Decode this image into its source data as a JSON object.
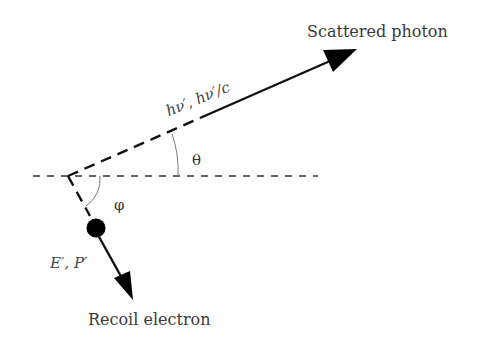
{
  "diagram": {
    "labels": {
      "scattered_photon": "Scattered photon",
      "photon_quantity": "hν′, hν′/c",
      "theta": "θ",
      "phi": "φ",
      "electron_quantity": "E′, P′",
      "recoil_electron": "Recoil electron"
    },
    "colors": {
      "line": "#111111",
      "arc": "#777777",
      "text": "#333333",
      "background": "#ffffff"
    },
    "geometry": {
      "origin": [
        68,
        176
      ],
      "incident_axis": {
        "x1": 33,
        "x2": 318,
        "y": 176,
        "style": "dashed"
      },
      "photon_direction": {
        "dashed_to": [
          200,
          118
        ],
        "arrow_tip": [
          356,
          50
        ]
      },
      "electron_direction": {
        "dashed_to": [
          90,
          216
        ],
        "dot_center": [
          96,
          228
        ],
        "dot_radius": 9,
        "arrow_tip": [
          132,
          300
        ]
      }
    }
  }
}
